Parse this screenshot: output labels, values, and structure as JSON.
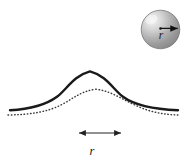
{
  "figure": {
    "title": "",
    "background_color": "#ffffff",
    "width": 185,
    "height": 159
  },
  "sphere": {
    "name": "shaded-sphere",
    "center_x": 160.5,
    "center_y": 29.5,
    "radius": 19.5,
    "fill_light": "#f2f2f2",
    "fill_mid": "#b8b8b8",
    "fill_dark": "#8a8a8a",
    "outline_color": "#555555",
    "highlight_x": 151,
    "highlight_y": 19,
    "radius_arrow": {
      "name": "sphere-radius-arrow",
      "from_x": 160.5,
      "from_y": 28.5,
      "to_x": 179,
      "to_y": 28.5,
      "color": "#111111"
    },
    "radius_label": "r",
    "radius_label_x": 161,
    "radius_label_y": 38
  },
  "curves": {
    "solid": {
      "name": "solid-bell-curve",
      "label": "",
      "color": "#1a1a1a",
      "stroke_width": 2.4,
      "peak_x": 90,
      "peak_y": 71,
      "baseline_y": 110,
      "start_x": 10,
      "end_x": 178,
      "path": "M 10,110 C 32,108 46,104 58,95 C 68,87 74,76 90,71.5 C 106,76 112,87 122,95 C 134,104 150,108 178,110"
    },
    "dotted": {
      "name": "dotted-bell-curve",
      "label": "",
      "color": "#3a3a3a",
      "stroke_width": 1.5,
      "dash": "0.6 2.6",
      "peak_x": 96,
      "peak_y": 89,
      "baseline_y": 114,
      "start_x": 8,
      "end_x": 178,
      "path": "M 8,115 C 30,114.5 46,112 60,105 C 72,99 80,91 96,89.2 C 112,91 122,99 136,105 C 150,112 164,114.5 178,115"
    }
  },
  "measure": {
    "name": "r-span-arrow",
    "label": "r",
    "arrow_start_x": 78,
    "arrow_end_x": 122,
    "arrow_y": 133,
    "color": "#222222",
    "label_x": 92,
    "label_y": 154
  }
}
